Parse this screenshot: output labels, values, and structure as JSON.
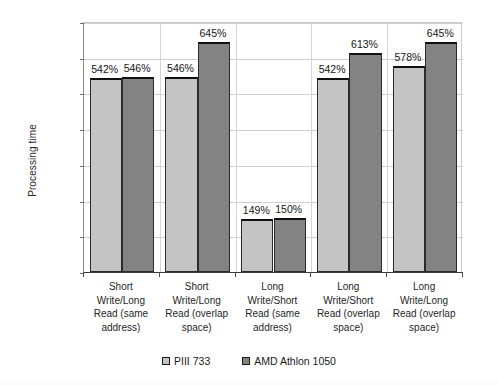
{
  "chart_data": {
    "type": "bar",
    "title": "",
    "xlabel": "",
    "ylabel": "Processing time",
    "ylim": [
      0,
      700
    ],
    "ytick_step": 100,
    "ytick_labels": [
      "0%",
      "100%",
      "200%",
      "300%",
      "400%",
      "500%",
      "600%",
      "700%"
    ],
    "grid": true,
    "legend_position": "bottom",
    "categories": [
      "Short Write/Long Read (same address)",
      "Short Write/Long Read (overlap space)",
      "Long Write/Short Read (same address)",
      "Long Write/Short Read (overlap space)",
      "Long Write/Long Read (overlap space)"
    ],
    "category_lines": [
      [
        "Short",
        "Write/Long",
        "Read (same",
        "address)"
      ],
      [
        "Short",
        "Write/Long",
        "Read (overlap",
        "space)"
      ],
      [
        "Long",
        "Write/Short",
        "Read (same",
        "address)"
      ],
      [
        "Long",
        "Write/Short",
        "Read (overlap",
        "space)"
      ],
      [
        "Long",
        "Write/Long",
        "Read (overlap",
        "space)"
      ]
    ],
    "series": [
      {
        "name": "PIII 733",
        "color": "#c4c4c4",
        "values": [
          542,
          546,
          149,
          542,
          578
        ],
        "labels": [
          "542%",
          "546%",
          "149%",
          "542%",
          "578%"
        ]
      },
      {
        "name": "AMD Athlon 1050",
        "color": "#838383",
        "values": [
          546,
          645,
          150,
          613,
          645
        ],
        "labels": [
          "546%",
          "645%",
          "150%",
          "613%",
          "645%"
        ]
      }
    ]
  },
  "legend": {
    "items": [
      {
        "label": "PIII 733"
      },
      {
        "label": "AMD Athlon 1050"
      }
    ]
  }
}
